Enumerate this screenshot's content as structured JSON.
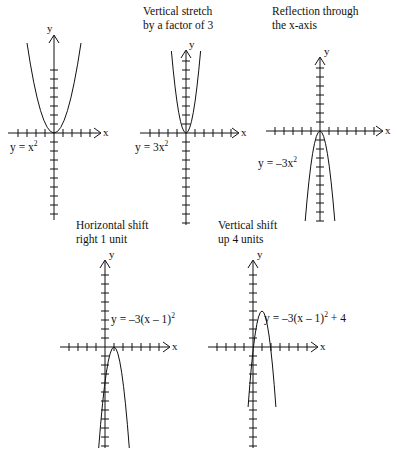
{
  "figure": {
    "font_color": "#111111",
    "background": "#ffffff"
  },
  "panels": [
    {
      "id": "base",
      "caption": "",
      "equation_html": "y = x<sup>2</sup>",
      "equation_text": "y = x^2",
      "x_axis_label": "x",
      "y_axis_label": "y",
      "ticks": {
        "x_left": 4,
        "x_right": 5,
        "y_up": 6,
        "y_down": 6,
        "spacing": 9
      },
      "curve": {
        "a": 1,
        "h": 0,
        "k": 0,
        "opens": "up"
      }
    },
    {
      "id": "vertical-stretch",
      "caption": "Vertical stretch\nby a factor of 3",
      "equation_html": "y = 3x<sup>2</sup>",
      "equation_text": "y = 3x^2",
      "x_axis_label": "x",
      "y_axis_label": "y",
      "ticks": {
        "x_left": 4,
        "x_right": 6,
        "y_up": 7,
        "y_down": 7,
        "spacing": 9
      },
      "curve": {
        "a": 3,
        "h": 0,
        "k": 0,
        "opens": "up"
      }
    },
    {
      "id": "reflection",
      "caption": "Reflection through\nthe x-axis",
      "equation_html": "y = &#8211;3x<sup>2</sup>",
      "equation_text": "y = -3x^2",
      "x_axis_label": "x",
      "y_axis_label": "y",
      "ticks": {
        "x_left": 5,
        "x_right": 6,
        "y_up": 7,
        "y_down": 8,
        "spacing": 9
      },
      "curve": {
        "a": -3,
        "h": 0,
        "k": 0,
        "opens": "down"
      }
    },
    {
      "id": "horizontal-shift",
      "caption": "Horizontal shift\nright 1 unit",
      "equation_html": "y = &#8211;3(x &#8211; 1)<sup>2</sup>",
      "equation_text": "y = -3(x - 1)^2",
      "x_axis_label": "x",
      "y_axis_label": "y",
      "ticks": {
        "x_left": 5,
        "x_right": 6,
        "y_up": 7,
        "y_down": 9,
        "spacing": 9
      },
      "curve": {
        "a": -3,
        "h": 1,
        "k": 0,
        "opens": "down"
      }
    },
    {
      "id": "vertical-shift",
      "caption": "Vertical shift\nup 4 units",
      "equation_html": "y = &#8211;3(x &#8211; 1)<sup>2</sup> + 4",
      "equation_text": "y = -3(x - 1)^2 + 4",
      "x_axis_label": "x",
      "y_axis_label": "y",
      "ticks": {
        "x_left": 5,
        "x_right": 6,
        "y_up": 7,
        "y_down": 9,
        "spacing": 9
      },
      "curve": {
        "a": -3,
        "h": 1,
        "k": 4,
        "opens": "down"
      }
    }
  ],
  "chart_data": {
    "type": "line",
    "xlabel": "x",
    "ylabel": "y",
    "grid": false,
    "legend": "none",
    "series": [
      {
        "name": "y = x^2",
        "a": 1,
        "h": 0,
        "k": 0,
        "caption": ""
      },
      {
        "name": "y = 3x^2",
        "a": 3,
        "h": 0,
        "k": 0,
        "caption": "Vertical stretch by a factor of 3"
      },
      {
        "name": "y = -3x^2",
        "a": -3,
        "h": 0,
        "k": 0,
        "caption": "Reflection through the x-axis"
      },
      {
        "name": "y = -3(x - 1)^2",
        "a": -3,
        "h": 1,
        "k": 0,
        "caption": "Horizontal shift right 1 unit"
      },
      {
        "name": "y = -3(x - 1)^2 + 4",
        "a": -3,
        "h": 1,
        "k": 4,
        "caption": "Vertical shift up 4 units"
      }
    ]
  }
}
